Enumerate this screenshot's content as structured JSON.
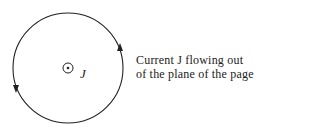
{
  "diagram": {
    "center_symbol": "dot-in-circle",
    "center_label": "J",
    "caption_line1": "Current J flowing out",
    "caption_line2": "of the plane of the page",
    "loop_direction": "counterclockwise",
    "stroke_color": "#222222"
  }
}
